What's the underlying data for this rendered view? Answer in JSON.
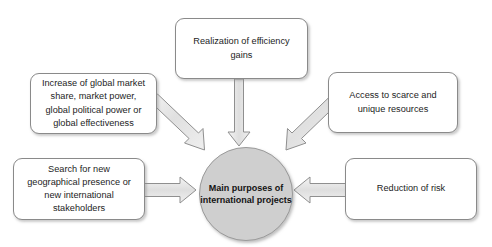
{
  "diagram": {
    "title": "Main purposes of international projects",
    "type": "converging-arrow-hub-diagram",
    "center": {
      "label": "Main purposes of international projects",
      "line1": "Main",
      "line2": "purposes of",
      "line3": "international",
      "line4": "projects",
      "fill_color": "#cfcfcf",
      "border_color": "#9a9a9a",
      "text_color": "#131313"
    },
    "style": {
      "box_fill": "#ffffff",
      "box_border": "#8a8a8a",
      "arrow_fill": "#e3e3e3",
      "arrow_border": "#8f8f8f",
      "background": "#ffffff"
    },
    "nodes": [
      {
        "id": "efficiency",
        "label": "Realization of efficiency gains",
        "line1": "Realization of efficiency",
        "line2": "gains",
        "position": "top",
        "arrow_direction": "down"
      },
      {
        "id": "market",
        "label": "Increase of global market share, market power, global political power or global effectiveness",
        "line1": "Increase of global market",
        "line2": "share, market power,",
        "line3": "global political power or",
        "line4": "global effectiveness",
        "position": "top-left",
        "arrow_direction": "down-right"
      },
      {
        "id": "resources",
        "label": "Access to scarce and unique resources",
        "line1": "Access to scarce and",
        "line2": "unique resources",
        "position": "top-right",
        "arrow_direction": "down-left"
      },
      {
        "id": "search",
        "label": "Search for new geographical presence or new international stakeholders",
        "line1": "Search for new",
        "line2": "geographical presence or",
        "line3": "new international",
        "line4": "stakeholders",
        "position": "bottom-left",
        "arrow_direction": "right"
      },
      {
        "id": "risk",
        "label": "Reduction of risk",
        "line1": "Reduction of risk",
        "position": "bottom-right",
        "arrow_direction": "left"
      }
    ]
  }
}
